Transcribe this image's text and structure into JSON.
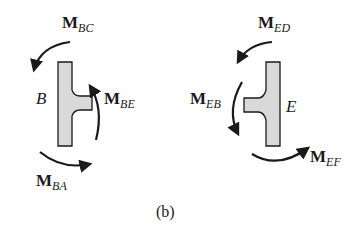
{
  "figure": {
    "caption": "(b)",
    "joints": [
      {
        "id": "B",
        "label": "B",
        "moments": [
          {
            "name": "M",
            "sub": "BC",
            "position": "top"
          },
          {
            "name": "M",
            "sub": "BE",
            "position": "right"
          },
          {
            "name": "M",
            "sub": "BA",
            "position": "bottom"
          }
        ]
      },
      {
        "id": "E",
        "label": "E",
        "moments": [
          {
            "name": "M",
            "sub": "ED",
            "position": "top"
          },
          {
            "name": "M",
            "sub": "EB",
            "position": "left"
          },
          {
            "name": "M",
            "sub": "EF",
            "position": "bottom"
          }
        ]
      }
    ],
    "colors": {
      "shape_fill": "#d9d9d9",
      "stroke": "#1a1a1a"
    }
  }
}
